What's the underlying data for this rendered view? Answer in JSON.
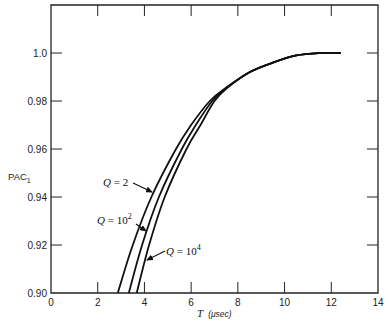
{
  "chart_data": {
    "type": "line",
    "title": "",
    "xlabel": "T (μsec)",
    "xlabel_var": "T",
    "xlabel_unit": "(μsec)",
    "ylabel": "PAC1",
    "ylabel_main": "PAC",
    "ylabel_sub": "1",
    "xlim": [
      0,
      14
    ],
    "ylim": [
      0.9,
      1.02
    ],
    "x_ticks": [
      0,
      2,
      4,
      6,
      8,
      10,
      12,
      14
    ],
    "x_tick_labels": [
      "0",
      "2",
      "4",
      "6",
      "8",
      "10",
      "12",
      "14"
    ],
    "y_ticks": [
      0.9,
      0.92,
      0.94,
      0.96,
      0.98,
      1.0
    ],
    "y_tick_labels": [
      "0.90",
      "0.92",
      "0.94",
      "0.96",
      "0.98",
      "1.0"
    ],
    "grid": false,
    "legend": "inline annotations with arrows",
    "series": [
      {
        "name": "Q = 2",
        "label_main": "Q = 2",
        "label_sup": "",
        "x": [
          2.86,
          3.5,
          4.3,
          5.35,
          6.0,
          6.8,
          7.5,
          8.5,
          9.5,
          10.5,
          11.5,
          12.4
        ],
        "y": [
          0.9,
          0.92,
          0.94,
          0.96,
          0.97,
          0.98,
          0.9855,
          0.992,
          0.996,
          0.999,
          1.0,
          1.0
        ]
      },
      {
        "name": "Q = 10^2",
        "label_main": "Q = 10",
        "label_sup": "2",
        "x": [
          3.33,
          3.9,
          4.62,
          5.6,
          6.2,
          6.9,
          7.5,
          8.5,
          9.5,
          10.5,
          11.5,
          12.4
        ],
        "y": [
          0.9,
          0.92,
          0.94,
          0.96,
          0.97,
          0.98,
          0.9855,
          0.992,
          0.996,
          0.999,
          1.0,
          1.0
        ]
      },
      {
        "name": "Q = 10^4",
        "label_main": "Q = 10",
        "label_sup": "4",
        "x": [
          3.67,
          4.2,
          4.87,
          5.8,
          6.4,
          7.0,
          7.55,
          8.5,
          9.5,
          10.5,
          11.5,
          12.4
        ],
        "y": [
          0.9,
          0.92,
          0.94,
          0.96,
          0.97,
          0.98,
          0.9855,
          0.992,
          0.996,
          0.999,
          1.0,
          1.0
        ]
      }
    ],
    "annotations": [
      {
        "series": 0,
        "text_x": 103,
        "text_y": 186,
        "arrow_from": [
          133,
          183
        ],
        "arrow_to": [
          152,
          192
        ]
      },
      {
        "series": 1,
        "text_x": 97,
        "text_y": 224,
        "arrow_from": [
          136,
          224
        ],
        "arrow_to": [
          146,
          231
        ]
      },
      {
        "series": 2,
        "text_x": 166,
        "text_y": 255,
        "arrow_from": [
          165,
          251
        ],
        "arrow_to": [
          147,
          260
        ]
      }
    ],
    "colors": {
      "axis": "#222222",
      "line": "#111111",
      "background": "#ffffff"
    }
  }
}
